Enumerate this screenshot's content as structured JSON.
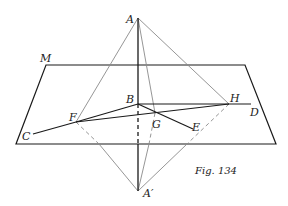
{
  "figure": {
    "caption": "Fig. 134",
    "colors": {
      "dark_line": "#1a1a1a",
      "light_line": "#8a8a8a",
      "background": "#ffffff"
    },
    "plane": {
      "label": "M",
      "corners": [
        [
          46,
          65
        ],
        [
          245,
          65
        ],
        [
          276,
          144
        ],
        [
          16,
          144
        ]
      ]
    },
    "points": {
      "A": {
        "label": "A",
        "x": 138,
        "y": 18
      },
      "A_prime": {
        "label": "A′",
        "x": 138,
        "y": 191
      },
      "B": {
        "label": "B",
        "x": 138,
        "y": 104
      },
      "C": {
        "label": "C",
        "x": 33,
        "y": 134
      },
      "D": {
        "label": "D",
        "x": 251,
        "y": 104
      },
      "E": {
        "label": "E",
        "x": 193,
        "y": 129
      },
      "F": {
        "label": "F",
        "x": 76,
        "y": 122
      },
      "G": {
        "label": "G",
        "x": 155,
        "y": 113
      },
      "H": {
        "label": "H",
        "x": 229,
        "y": 104
      }
    }
  }
}
